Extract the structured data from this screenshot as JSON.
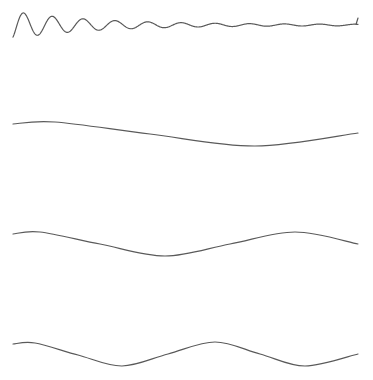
{
  "chart_data": [
    {
      "type": "line",
      "title": "",
      "xlabel": "",
      "ylabel": "",
      "grid": false,
      "axes_visible": false,
      "description": "Damped oscillation with decaying amplitude, ~10 cycles, small upward tick at end",
      "x_range": [
        13,
        358
      ],
      "baseline_y": 25,
      "amplitude_start": 13,
      "decay": 0.012,
      "cycles": 10.5,
      "end_tick": true,
      "panel": {
        "top": 8,
        "height": 40
      }
    },
    {
      "type": "line",
      "title": "",
      "xlabel": "",
      "ylabel": "",
      "grid": false,
      "axes_visible": false,
      "description": "Slow sinusoid, ~0.8 period across width",
      "x": [
        13,
        55,
        150,
        255,
        358
      ],
      "y": [
        124,
        122,
        134,
        146,
        133
      ],
      "panel": {
        "top": 115,
        "height": 40
      }
    },
    {
      "type": "line",
      "title": "",
      "xlabel": "",
      "ylabel": "",
      "grid": false,
      "axes_visible": false,
      "description": "Sinusoid, ~1.3 periods across width",
      "x": [
        13,
        40,
        100,
        165,
        230,
        295,
        358
      ],
      "y": [
        234,
        232,
        244,
        256,
        244,
        232,
        244
      ],
      "panel": {
        "top": 225,
        "height": 40
      }
    },
    {
      "type": "line",
      "title": "",
      "xlabel": "",
      "ylabel": "",
      "grid": false,
      "axes_visible": false,
      "description": "Sinusoid, ~1.8 periods across width",
      "x": [
        13,
        35,
        78,
        122,
        168,
        215,
        260,
        305,
        358
      ],
      "y": [
        344,
        343,
        355,
        366,
        354,
        342,
        354,
        366,
        354
      ],
      "panel": {
        "top": 335,
        "height": 40
      }
    }
  ],
  "colors": {
    "line": "#5a5a5a",
    "background": "#ffffff"
  }
}
